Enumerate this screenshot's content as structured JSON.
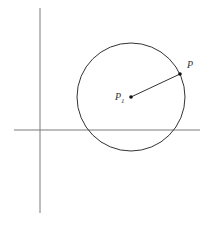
{
  "diagram": {
    "type": "geometry-circle",
    "colors": {
      "background": "#ffffff",
      "axes": "#7a7a7a",
      "circle": "#333333",
      "radius": "#333333",
      "points": "#111111",
      "labels": "#333333"
    },
    "axes": {
      "vertical": {
        "x": 40,
        "y1": 8,
        "y2": 213
      },
      "horizontal": {
        "y": 130,
        "x1": 14,
        "x2": 200
      }
    },
    "circle": {
      "cx": 131,
      "cy": 97,
      "r": 54
    },
    "points": {
      "center": {
        "x": 131,
        "y": 97,
        "label": "P",
        "subscript": "1"
      },
      "on_circle": {
        "x": 180,
        "y": 74,
        "label": "P",
        "subscript": ""
      }
    },
    "labels": {
      "center_label": "P",
      "center_subscript": "1",
      "point_label": "P"
    }
  }
}
